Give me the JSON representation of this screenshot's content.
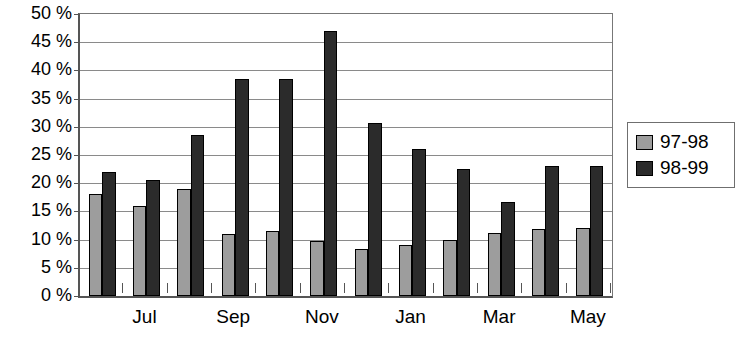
{
  "chart_data": {
    "type": "bar",
    "title": "",
    "subtitle": "",
    "xlabel": "",
    "ylabel": "",
    "categories": [
      "Jun",
      "Jul",
      "Aug",
      "Sep",
      "Oct",
      "Nov",
      "Dec",
      "Jan",
      "Feb",
      "Mar",
      "Apr",
      "May"
    ],
    "visible_tick_labels": [
      "Jul",
      "Sep",
      "Nov",
      "Jan",
      "Mar",
      "May"
    ],
    "visible_tick_category_indices": [
      1,
      3,
      5,
      7,
      9,
      11
    ],
    "series": [
      {
        "name": "97-98",
        "color": "#9d9d9d",
        "values": [
          18.0,
          16.0,
          19.0,
          11.0,
          11.5,
          9.7,
          8.3,
          9.0,
          10.0,
          11.2,
          11.8,
          12.0
        ]
      },
      {
        "name": "98-99",
        "color": "#2b2b2b",
        "values": [
          22.0,
          20.5,
          28.5,
          38.5,
          38.5,
          47.0,
          30.7,
          26.0,
          22.5,
          16.7,
          23.0,
          23.0
        ]
      }
    ],
    "ylim": [
      0,
      50
    ],
    "ytick_step": 5,
    "ytick_values": [
      50,
      45,
      40,
      35,
      30,
      25,
      20,
      15,
      10,
      5,
      0
    ],
    "ytick_labels": [
      "50 %",
      "45 %",
      "40 %",
      "35 %",
      "30 %",
      "25 %",
      "20 %",
      "15 %",
      "10 %",
      "5 %",
      "0 %"
    ],
    "grid": true,
    "grid_axis": "y",
    "legend_position": "right"
  }
}
